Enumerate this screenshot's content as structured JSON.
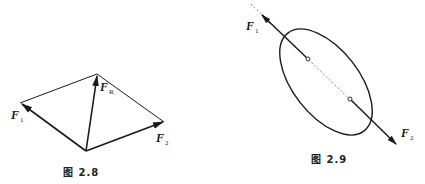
{
  "figures": [
    {
      "id": "fig-2-8",
      "caption": "图 2.8",
      "type": "parallelogram-of-forces",
      "labels": {
        "f1": {
          "main": "F",
          "sub": "1"
        },
        "f2": {
          "main": "F",
          "sub": "2"
        },
        "fr": {
          "main": "F",
          "sub": "R"
        }
      }
    },
    {
      "id": "fig-2-9",
      "caption": "图 2.9",
      "type": "two-force-body",
      "labels": {
        "f1": {
          "main": "F",
          "sub": "1"
        },
        "f2": {
          "main": "F",
          "sub": "2"
        }
      }
    }
  ],
  "colors": {
    "line": "#1a1a1a",
    "background": "#ffffff"
  }
}
